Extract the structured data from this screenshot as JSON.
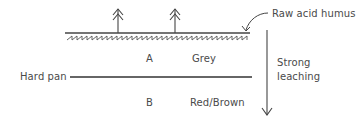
{
  "diagram": {
    "colors": {
      "ink": "#4a4a4a",
      "background": "#ffffff"
    },
    "labels": {
      "humus": "Raw acid humus",
      "horizon_a": "A",
      "horizon_a_color": "Grey",
      "hard_pan": "Hard pan",
      "horizon_b": "B",
      "horizon_b_color": "Red/Brown",
      "leaching_line1": "Strong",
      "leaching_line2": "leaching"
    },
    "icons": {
      "trees": [
        "coniferous-tree-icon",
        "coniferous-tree-icon"
      ],
      "humus_pointer": "curved-arrow-icon",
      "leaching_arrow": "down-arrow-icon"
    }
  }
}
